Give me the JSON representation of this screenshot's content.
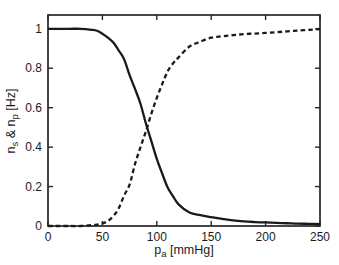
{
  "figure": {
    "background": "#ffffff",
    "curve_color": "#1a1a1a",
    "axis_color": "#262626"
  },
  "chart_data": {
    "type": "line",
    "title": "",
    "xlabel": "pa [mmHg]",
    "ylabel": "ns & np [Hz]",
    "xlabel_parts": [
      {
        "text": "p",
        "sub": false
      },
      {
        "text": "a",
        "sub": true
      },
      {
        "text": " [mmHg]",
        "sub": false
      }
    ],
    "ylabel_parts": [
      {
        "text": "n",
        "sub": false
      },
      {
        "text": "s",
        "sub": true
      },
      {
        "text": " & n",
        "sub": false
      },
      {
        "text": "p",
        "sub": true
      },
      {
        "text": " [Hz]",
        "sub": false
      }
    ],
    "xlim": [
      0,
      250
    ],
    "ylim": [
      0,
      1.07
    ],
    "x_tick_labels": [
      "0",
      "50",
      "100",
      "150",
      "200",
      "250"
    ],
    "x_tick_values": [
      0,
      50,
      100,
      150,
      200,
      250
    ],
    "y_tick_labels": [
      "0",
      "0.2",
      "0.4",
      "0.6",
      "0.8",
      "1"
    ],
    "y_tick_values": [
      0,
      0.2,
      0.4,
      0.6,
      0.8,
      1
    ],
    "grid": false,
    "legend": null,
    "x": [
      0,
      10,
      20,
      30,
      40,
      45,
      50,
      55,
      60,
      65,
      70,
      75,
      80,
      85,
      90,
      95,
      100,
      105,
      110,
      115,
      120,
      130,
      140,
      150,
      160,
      170,
      180,
      190,
      200,
      210,
      220,
      230,
      240,
      250
    ],
    "series": [
      {
        "name": "n_s",
        "style": "solid",
        "values": [
          1,
          1,
          1,
          1,
          0.995,
          0.99,
          0.975,
          0.955,
          0.93,
          0.89,
          0.845,
          0.765,
          0.695,
          0.62,
          0.52,
          0.43,
          0.34,
          0.265,
          0.195,
          0.15,
          0.11,
          0.068,
          0.055,
          0.045,
          0.036,
          0.028,
          0.023,
          0.02,
          0.018,
          0.016,
          0.014,
          0.012,
          0.011,
          0.01
        ]
      },
      {
        "name": "n_p",
        "style": "dashed",
        "values": [
          0,
          0,
          0,
          0,
          0.004,
          0.007,
          0.013,
          0.025,
          0.05,
          0.09,
          0.155,
          0.21,
          0.315,
          0.4,
          0.48,
          0.57,
          0.65,
          0.72,
          0.785,
          0.825,
          0.855,
          0.91,
          0.935,
          0.955,
          0.962,
          0.968,
          0.973,
          0.976,
          0.979,
          0.983,
          0.987,
          0.991,
          0.995,
          0.999
        ]
      }
    ]
  }
}
